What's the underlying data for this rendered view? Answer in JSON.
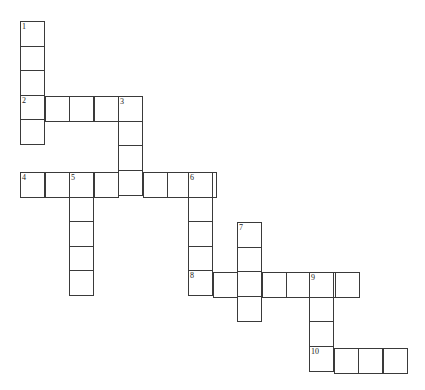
{
  "puzzle": {
    "type": "crossword",
    "cell_size": 24.5,
    "line_color": "#3a3a3a",
    "entries": [
      {
        "number": "1",
        "direction": "down",
        "x": 20,
        "y": 21,
        "length": 5
      },
      {
        "number": "2",
        "direction": "across",
        "x": 20,
        "y": 96,
        "length": 5
      },
      {
        "number": "3",
        "direction": "down",
        "x": 118,
        "y": 96,
        "length": 4
      },
      {
        "number": "4",
        "direction": "across",
        "x": 20,
        "y": 172,
        "length": 8
      },
      {
        "number": "5",
        "direction": "down",
        "x": 69,
        "y": 172,
        "length": 5
      },
      {
        "number": "6",
        "direction": "down",
        "x": 188,
        "y": 172,
        "length": 5
      },
      {
        "number": "7",
        "direction": "down",
        "x": 237,
        "y": 222,
        "length": 4
      },
      {
        "number": "8",
        "direction": "across",
        "x": 188,
        "y": 272,
        "length": 7
      },
      {
        "number": "9",
        "direction": "down",
        "x": 309,
        "y": 272,
        "length": 4
      },
      {
        "number": "10",
        "direction": "across",
        "x": 309,
        "y": 348,
        "length": 4
      }
    ]
  }
}
